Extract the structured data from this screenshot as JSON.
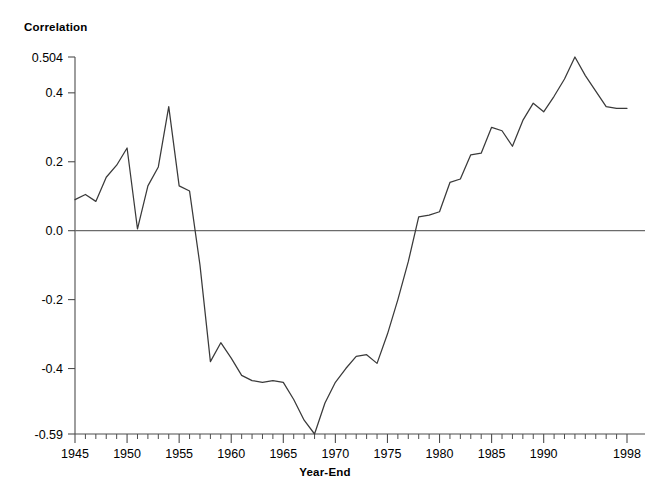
{
  "chart_data": {
    "type": "line",
    "title": "",
    "xlabel": "Year-End",
    "ylabel": "Correlation",
    "xlim": [
      1945,
      1998
    ],
    "ylim": [
      -0.59,
      0.504
    ],
    "grid": false,
    "legend": false,
    "x_tick_labels": [
      "1945",
      "1950",
      "1955",
      "1960",
      "1965",
      "1970",
      "1975",
      "1980",
      "1985",
      "1990",
      "1998"
    ],
    "x_tick_values": [
      1945,
      1950,
      1955,
      1960,
      1965,
      1970,
      1975,
      1980,
      1985,
      1990,
      1998
    ],
    "y_tick_labels": [
      "0.504",
      "0.4",
      "0.2",
      "0.0",
      "-0.2",
      "-0.4",
      "-0.59"
    ],
    "y_tick_values": [
      0.504,
      0.4,
      0.2,
      0.0,
      -0.2,
      -0.4,
      -0.59
    ],
    "line_color": "#3a3a3a",
    "zero_line_color": "#6b6b6b",
    "x": [
      1945,
      1946,
      1947,
      1948,
      1949,
      1950,
      1951,
      1952,
      1953,
      1954,
      1955,
      1956,
      1957,
      1958,
      1959,
      1960,
      1961,
      1962,
      1963,
      1964,
      1965,
      1966,
      1967,
      1968,
      1969,
      1970,
      1971,
      1972,
      1973,
      1974,
      1975,
      1976,
      1977,
      1978,
      1979,
      1980,
      1981,
      1982,
      1983,
      1984,
      1985,
      1986,
      1987,
      1988,
      1989,
      1990,
      1991,
      1992,
      1993,
      1994,
      1995,
      1996,
      1997,
      1998
    ],
    "y": [
      0.09,
      0.105,
      0.085,
      0.155,
      0.19,
      0.24,
      0.005,
      0.13,
      0.185,
      0.36,
      0.13,
      0.115,
      -0.1,
      -0.38,
      -0.325,
      -0.37,
      -0.42,
      -0.435,
      -0.44,
      -0.435,
      -0.44,
      -0.49,
      -0.55,
      -0.59,
      -0.5,
      -0.44,
      -0.4,
      -0.365,
      -0.36,
      -0.385,
      -0.3,
      -0.2,
      -0.09,
      0.04,
      0.045,
      0.055,
      0.14,
      0.15,
      0.22,
      0.225,
      0.3,
      0.29,
      0.245,
      0.32,
      0.37,
      0.345,
      0.39,
      0.44,
      0.504,
      0.45,
      0.405,
      0.36,
      0.355,
      0.355
    ]
  },
  "labels": {
    "y_axis_title": "Correlation",
    "x_axis_title": "Year-End"
  }
}
